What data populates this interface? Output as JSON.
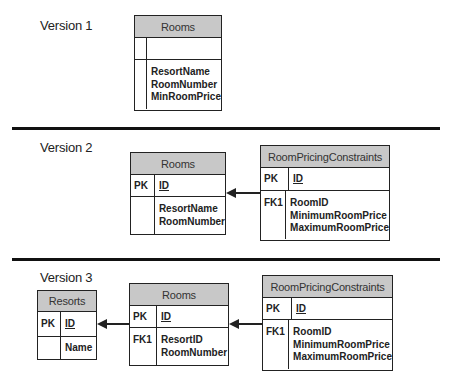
{
  "versions": [
    {
      "label": "Version 1",
      "entities": {
        "rooms": {
          "title": "Rooms",
          "pk_key": "",
          "pk_attr": "",
          "body_key": "",
          "attributes": [
            "ResortName",
            "RoomNumber",
            "MinRoomPrice"
          ]
        }
      }
    },
    {
      "label": "Version 2",
      "entities": {
        "rooms": {
          "title": "Rooms",
          "pk_key": "PK",
          "pk_attr": "ID",
          "body_key": "",
          "attributes": [
            "ResortName",
            "RoomNumber"
          ]
        },
        "room_pricing_constraints": {
          "title": "RoomPricingConstraints",
          "pk_key": "PK",
          "pk_attr": "ID",
          "body_key": "FK1",
          "attributes": [
            "RoomID",
            "MinimumRoomPrice",
            "MaximumRoomPrice"
          ]
        }
      },
      "relationships": [
        {
          "from": "RoomPricingConstraints",
          "to": "Rooms"
        }
      ]
    },
    {
      "label": "Version 3",
      "entities": {
        "resorts": {
          "title": "Resorts",
          "pk_key": "PK",
          "pk_attr": "ID",
          "body_key": "",
          "attributes": [
            "Name"
          ]
        },
        "rooms": {
          "title": "Rooms",
          "pk_key": "PK",
          "pk_attr": "ID",
          "body_key": "FK1",
          "attributes": [
            "ResortID",
            "RoomNumber"
          ]
        },
        "room_pricing_constraints": {
          "title": "RoomPricingConstraints",
          "pk_key": "PK",
          "pk_attr": "ID",
          "body_key": "FK1",
          "attributes": [
            "RoomID",
            "MinimumRoomPrice",
            "MaximumRoomPrice"
          ]
        }
      },
      "relationships": [
        {
          "from": "Rooms",
          "to": "Resorts"
        },
        {
          "from": "RoomPricingConstraints",
          "to": "Rooms"
        }
      ]
    }
  ],
  "colors": {
    "header_fill": "#c8c8c8",
    "line": "#222222"
  }
}
